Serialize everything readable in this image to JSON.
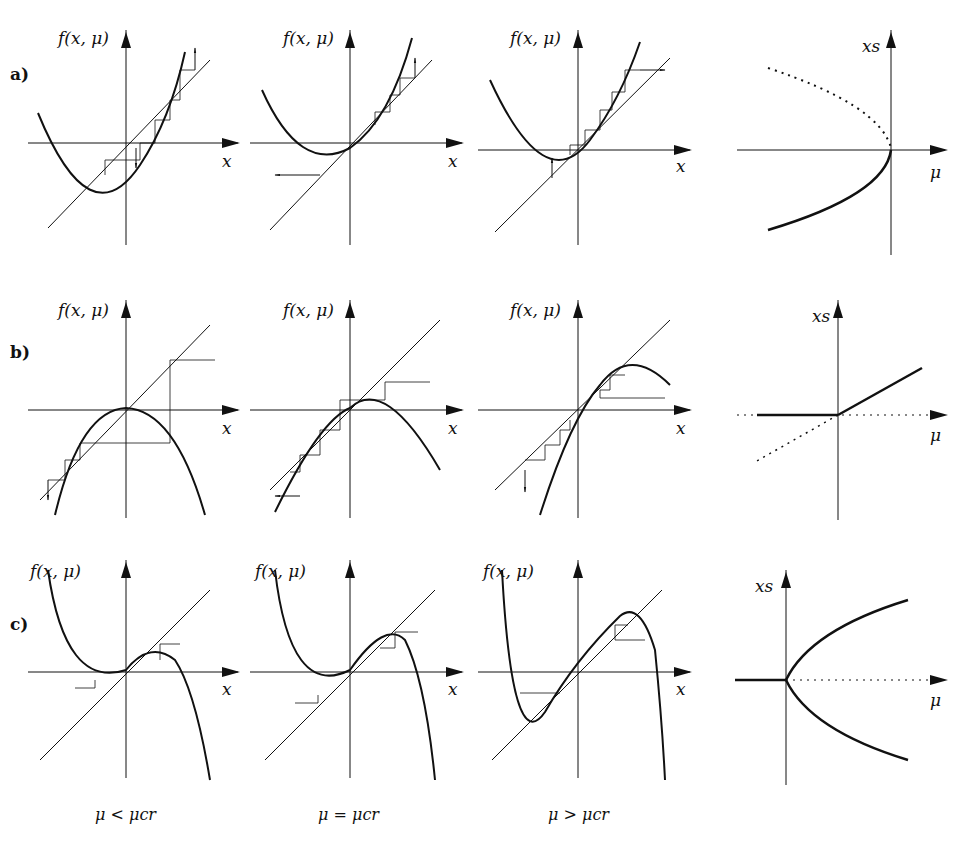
{
  "figure": {
    "rows": [
      {
        "label": "a)",
        "type": "saddle-node (tangent) bifurcation"
      },
      {
        "label": "b)",
        "type": "transcritical bifurcation"
      },
      {
        "label": "c)",
        "type": "pitchfork bifurcation"
      }
    ],
    "axis_labels": {
      "map_y": "f(x, μ)",
      "map_x": "x",
      "bif_y": "xs",
      "bif_x": "μ"
    },
    "captions": [
      "μ < μcr",
      "μ = μcr",
      "μ > μcr"
    ],
    "legend": {
      "solid": "stable fixed point",
      "dotted": "unstable fixed point"
    }
  },
  "colors": {
    "ink": "#111111",
    "background": "#ffffff"
  }
}
